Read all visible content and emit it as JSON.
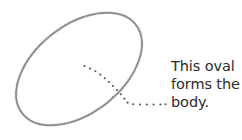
{
  "figure": {
    "type": "hand-drawn-sketch-annotation",
    "background_color": "#ffffff",
    "stroke_color": "#7b7b7b",
    "dot_color": "#555555",
    "text_color": "#2b2b2b",
    "shape": {
      "name": "oval",
      "style": "hand-drawn pencil outline",
      "center_x": 79,
      "center_y": 69,
      "radius_x": 72,
      "radius_y": 44,
      "rotation_deg": -38
    },
    "leader_line": {
      "name": "dotted-leader-line",
      "style": "dotted",
      "points": [
        [
          84,
          66
        ],
        [
          128,
          104
        ],
        [
          165,
          104
        ]
      ]
    }
  },
  "annotation": {
    "label": "This oval\nforms the\nbody.",
    "line_1": "This oval",
    "line_2": "forms the",
    "line_3": "body.",
    "x": 171,
    "y": 58
  }
}
